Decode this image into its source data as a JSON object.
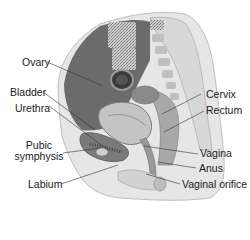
{
  "labels": {
    "ovary": "Ovary",
    "bladder": "Bladder",
    "urethra": "Urethra",
    "pubic_symphysis_1": "Pubic",
    "pubic_symphysis_2": "symphysis",
    "labium": "Labium",
    "cervix": "Cervix",
    "rectum": "Rectum",
    "vagina": "Vagina",
    "anus": "Anus",
    "vaginal_orifice": "Vaginal orifice"
  },
  "colors": {
    "tissue_dark": "#6b6b6b",
    "tissue_mid": "#9a9a9a",
    "tissue_light": "#d4d4d4",
    "skin": "#e6e6e6",
    "bone": "#bdbdbd",
    "leader_line": "#333333"
  }
}
